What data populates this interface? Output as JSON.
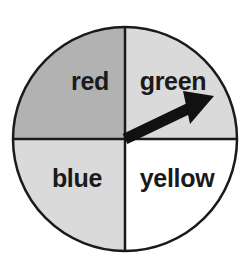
{
  "figure": {
    "type": "spinner-wheel",
    "background_color": "#ffffff",
    "outline_color": "#1a1a1a"
  },
  "wheel": {
    "center_x": 125,
    "center_y": 139,
    "radius": 112,
    "outline_width": 2.5,
    "divider_width": 2.5,
    "sectors": [
      {
        "label": "red",
        "position": "top-left",
        "start_angle": 180,
        "end_angle": 270,
        "fill": "#b2b2b2",
        "label_x": 90,
        "label_y": 90
      },
      {
        "label": "green",
        "position": "top-right",
        "start_angle": 270,
        "end_angle": 360,
        "fill": "#dadada",
        "label_x": 172,
        "label_y": 90
      },
      {
        "label": "blue",
        "position": "bottom-left",
        "start_angle": 90,
        "end_angle": 180,
        "fill": "#dadada",
        "label_x": 76,
        "label_y": 186
      },
      {
        "label": "yellow",
        "position": "bottom-right",
        "start_angle": 0,
        "end_angle": 90,
        "fill": "#ffffff",
        "label_x": 176,
        "label_y": 186
      }
    ]
  },
  "pointer": {
    "name": "spinner-arrow",
    "color": "#111111",
    "points_to_sector": "green",
    "angle_degrees": 33,
    "tail_x": 125,
    "tail_y": 139,
    "tip_x": 214,
    "tip_y": 96
  }
}
